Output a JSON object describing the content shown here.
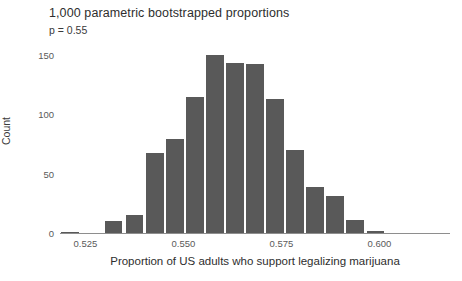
{
  "chart_data": {
    "type": "bar",
    "title": "1,000 parametric bootstrapped proportions",
    "subtitle": "p = 0.55",
    "xlabel": "Proportion of US adults who support legalizing marijuana",
    "ylabel": "Count",
    "grid": false,
    "legend": null,
    "xlim": [
      0.5185,
      0.618
    ],
    "ylim": [
      0,
      158
    ],
    "xticks": [
      0.525,
      0.55,
      0.575,
      0.6
    ],
    "xtick_labels": [
      "0.525",
      "0.550",
      "0.575",
      "0.600"
    ],
    "yticks": [
      0,
      50,
      100,
      150
    ],
    "ytick_labels": [
      "0",
      "50",
      "100",
      "150"
    ],
    "bin_width": 0.005,
    "bar_color": "#595959",
    "categories": [
      "0.5200",
      "0.5250",
      "0.5300",
      "0.5350",
      "0.5400",
      "0.5450",
      "0.5500",
      "0.5550",
      "0.5600",
      "0.5650",
      "0.5700",
      "0.5750",
      "0.5800",
      "0.5850",
      "0.5900"
    ],
    "bin_centers": [
      0.521,
      0.5322,
      0.5375,
      0.5427,
      0.5478,
      0.553,
      0.5581,
      0.5632,
      0.5683,
      0.5734,
      0.5785,
      0.5836,
      0.5887,
      0.5938,
      0.599
    ],
    "values": [
      1,
      10,
      15,
      67,
      79,
      114,
      150,
      143,
      142,
      113,
      70,
      39,
      31,
      11,
      2
    ]
  }
}
